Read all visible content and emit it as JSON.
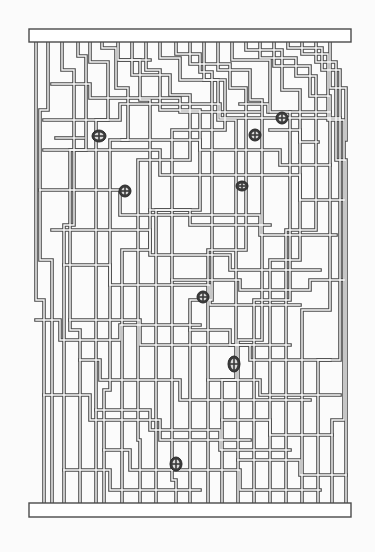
{
  "diagram": {
    "title": "Wire maze diagram",
    "colors": {
      "line": "#4a4a4a",
      "background": "#fbfbfb",
      "marker": "#3a3a3a"
    },
    "top_bar": {
      "x": 29,
      "y": 29,
      "width": 322,
      "height": 13
    },
    "bottom_bar": {
      "x": 29,
      "y": 503,
      "width": 322,
      "height": 14
    },
    "markers": [
      {
        "id": "m1",
        "x": 99,
        "y": 136,
        "rx": 7,
        "ry": 6
      },
      {
        "id": "m2",
        "x": 125,
        "y": 191,
        "rx": 6,
        "ry": 6
      },
      {
        "id": "m3",
        "x": 255,
        "y": 135,
        "rx": 6,
        "ry": 6
      },
      {
        "id": "m4",
        "x": 282,
        "y": 118,
        "rx": 6,
        "ry": 6
      },
      {
        "id": "m5",
        "x": 242,
        "y": 186,
        "rx": 6,
        "ry": 5
      },
      {
        "id": "m6",
        "x": 203,
        "y": 297,
        "rx": 6,
        "ry": 6
      },
      {
        "id": "m7",
        "x": 234,
        "y": 364,
        "rx": 6,
        "ry": 8
      },
      {
        "id": "m8",
        "x": 176,
        "y": 464,
        "rx": 6,
        "ry": 7
      }
    ],
    "wires": [
      "M36 42 V300 H44 V503",
      "M48 42 V110 H40 V260 H52 V503",
      "M62 42 V70 H74 V225 H64 V503",
      "M78 42 V56 H86 V150 H70 V330 H80 V503",
      "M90 42 V62 H108 V120 H96 V503",
      "M102 42 V48 H116 V88 H128 V140 H110 V390 H104 V503",
      "M118 42 V60 H140 V100 H150 V250 H122 V503",
      "M132 42 V75 H170 V95 H190 V160 H138 V440 H140 V503",
      "M146 42 V70 H160 V110 H200 V210 H156 V503",
      "M160 42 V58 H180 V80 H225 V130 H172 V480 H176 V503",
      "M176 42 V54 H200 V72 H212 V300 H190 V503",
      "M190 42 V64 H230 V88 H246 V250 H208 V503",
      "M204 42 V80 H218 V120 H236 V380 H222 V503",
      "M218 42 V70 H250 V100 H262 V340 H238 V503",
      "M232 42 V60 H270 V112 H290 V300 H254 V503",
      "M246 42 V50 H282 V90 H300 V260 H270 V503",
      "M260 42 V58 H296 V76 H316 V230 H286 V503",
      "M274 42 V66 H310 V96 H330 V310 H302 V503",
      "M288 42 V48 H322 V70 H340 V360 H318 V503",
      "M302 42 V54 H328 V120 H344 V420 H332 V503",
      "M316 42 V62 H336 V160 H346 V503",
      "M330 42 V88 H346 V140",
      "M44 150 H160 V175 H300 V200 H344",
      "M40 190 H120 V215 H260 V235 H336",
      "M52 230 H150 V255 H230 V270 H320",
      "M64 265 H110 V285 H210 V305 H300",
      "M70 320 H140 V345 H250 V360 H330",
      "M80 360 H100 V380 H180 V400 H310",
      "M96 410 H150 V430 H220 V450 H290",
      "M104 450 H130 V470 H240 V490 H320",
      "M44 120 H120 V104 H220 V118 H340",
      "M52 84 H90 V98 H180 V112 H260",
      "M36 320 H60 V340 H120 V325 H200",
      "M44 395 H90 V420 H160 V440 H250",
      "M64 470 H110 V490 H200",
      "M122 140 H200 V150 H280 V165 H330",
      "M150 210 H190 V225 H270",
      "M172 280 H240 V290 H310 V280 H344",
      "M190 330 H230 V345 H290",
      "M208 380 H260 V395 H340",
      "M222 420 H270 V435 H332",
      "M238 460 H300 V475 H346",
      "M56 138 H84",
      "M270 130 H300 V142 H318",
      "M120 60 H150",
      "M240 104 H268 V112",
      "M290 112 H330"
    ]
  }
}
